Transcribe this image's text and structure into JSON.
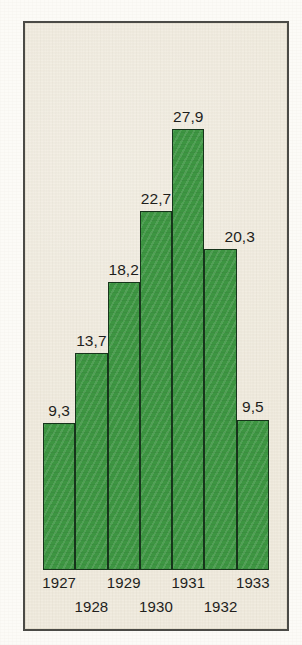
{
  "figure": {
    "background_color": "#f1ece0",
    "frame_color": "#4a4a46",
    "bar_color": "#3d9642",
    "bar_outline_color": "#15331a",
    "text_color": "#1d1d1b"
  },
  "chart_data": {
    "type": "bar",
    "title": "",
    "subtitle": "",
    "xlabel": "",
    "ylabel": "",
    "grid": false,
    "legend": false,
    "decimal_separator": ",",
    "ylim": [
      0,
      31
    ],
    "categories": [
      "1927",
      "1928",
      "1929",
      "1930",
      "1931",
      "1932",
      "1933"
    ],
    "values": [
      9.3,
      13.7,
      18.2,
      22.7,
      27.9,
      20.3,
      9.5
    ],
    "value_labels": [
      "9,3",
      "13,7",
      "18,2",
      "22,7",
      "27,9",
      "20,3",
      "9,5"
    ],
    "tick_labels_top_row": [
      "1927",
      "1929",
      "1931",
      "1933"
    ],
    "tick_labels_bottom_row": [
      "1928",
      "1930",
      "1932"
    ],
    "annotations": []
  }
}
